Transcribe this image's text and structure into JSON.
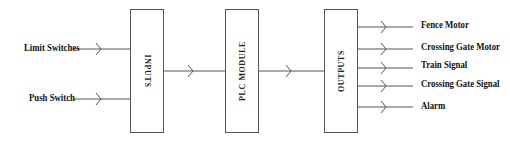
{
  "diagram": {
    "type": "block-diagram",
    "line_color": "#555555",
    "text_color": "#111111",
    "inputs": [
      {
        "label": "Limit Switches",
        "y": 49
      },
      {
        "label": "Push Switch",
        "y": 99
      }
    ],
    "blocks": [
      {
        "id": "inputs",
        "title": "INPUTS"
      },
      {
        "id": "plc",
        "title": "PLC MODULE"
      },
      {
        "id": "outputs",
        "title": "OUTPUTS"
      }
    ],
    "outputs": [
      {
        "label": "Fence Motor",
        "y": 27
      },
      {
        "label": "Crossing Gate Motor",
        "y": 49
      },
      {
        "label": "Train Signal",
        "y": 68
      },
      {
        "label": "Crossing Gate Signal",
        "y": 86
      },
      {
        "label": "Alarm",
        "y": 107
      }
    ],
    "edges": [
      {
        "from": "Limit Switches",
        "to": "INPUTS"
      },
      {
        "from": "Push Switch",
        "to": "INPUTS"
      },
      {
        "from": "INPUTS",
        "to": "PLC MODULE"
      },
      {
        "from": "PLC MODULE",
        "to": "OUTPUTS"
      },
      {
        "from": "OUTPUTS",
        "to": "Fence Motor"
      },
      {
        "from": "OUTPUTS",
        "to": "Crossing Gate Motor"
      },
      {
        "from": "OUTPUTS",
        "to": "Train Signal"
      },
      {
        "from": "OUTPUTS",
        "to": "Crossing Gate Signal"
      },
      {
        "from": "OUTPUTS",
        "to": "Alarm"
      }
    ]
  }
}
